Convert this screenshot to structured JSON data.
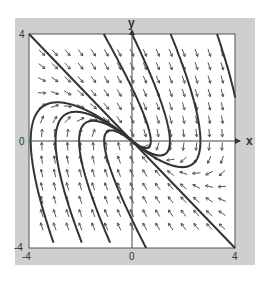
{
  "chart_data": {
    "type": "phase-portrait",
    "title": "",
    "xlabel": "x",
    "ylabel": "y",
    "xlim": [
      -4,
      4
    ],
    "ylim": [
      -4,
      4
    ],
    "x_ticks": [
      {
        "value": -4,
        "label": "-4"
      },
      {
        "value": 0,
        "label": "0"
      },
      {
        "value": 4,
        "label": "4"
      }
    ],
    "y_ticks": [
      {
        "value": 4,
        "label": "4"
      },
      {
        "value": 0,
        "label": "0"
      },
      {
        "value": -4,
        "label": "-4"
      }
    ],
    "system": {
      "dx_dt": "y",
      "dy_dt": "-x - 2y",
      "equilibrium": [
        0,
        0
      ],
      "type": "degenerate stable node",
      "eigenvalue": -1,
      "eigenvector": [
        1,
        -1
      ]
    },
    "direction_field": {
      "x_range": [
        -3.5,
        3.5
      ],
      "y_range": [
        -3.5,
        3.3
      ],
      "step": 0.5
    },
    "straight_line_solution": {
      "from": [
        -4,
        4
      ],
      "to": [
        4,
        -4
      ]
    },
    "trajectory_starts": [
      [
        -1.1,
        4
      ],
      [
        0,
        4
      ],
      [
        1.5,
        4
      ],
      [
        3.3,
        4
      ],
      [
        -3.05,
        -3.8
      ],
      [
        -1.95,
        -3.8
      ],
      [
        -0.85,
        -3.8
      ],
      [
        0.55,
        -4
      ]
    ],
    "grid": false,
    "legend": null
  }
}
